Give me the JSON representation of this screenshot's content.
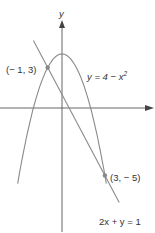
{
  "chart_data": {
    "type": "line",
    "title": "",
    "xlabel": "",
    "ylabel": "y",
    "grid": false,
    "axes": {
      "x_arrow": true,
      "y_arrow": true,
      "y_axis_label": "y"
    },
    "series": [
      {
        "name": "y = 4 − x²",
        "kind": "parabola",
        "equation": "y = 4 - x^2",
        "x_range": [
          -3.1,
          3.1
        ]
      },
      {
        "name": "2x + y = 1",
        "kind": "line",
        "equation": "y = 1 - 2x",
        "x_range": [
          -2.0,
          4.0
        ]
      }
    ],
    "points": [
      {
        "x": -1,
        "y": 3,
        "label": "(− 1, 3)"
      },
      {
        "x": 3,
        "y": -5,
        "label": "(3, − 5)"
      }
    ],
    "annotations": [
      {
        "text": "y = 4 − x²",
        "near": "parabola right branch"
      },
      {
        "text": "2x + y = 1",
        "near": "line bottom end"
      },
      {
        "text": "(− 1, 3)",
        "near": "left intersection"
      },
      {
        "text": "(3, − 5)",
        "near": "right intersection"
      }
    ],
    "colors": {
      "curve": "#8a8a8a",
      "axis": "#555555",
      "point": "#888888",
      "text": "#333333"
    }
  },
  "labels": {
    "y_axis": "y",
    "parabola_eq": "y = 4 − x",
    "parabola_exp": "2",
    "line_eq": "2x + y = 1",
    "point1": "(− 1, 3)",
    "point2": "(3, − 5)"
  }
}
